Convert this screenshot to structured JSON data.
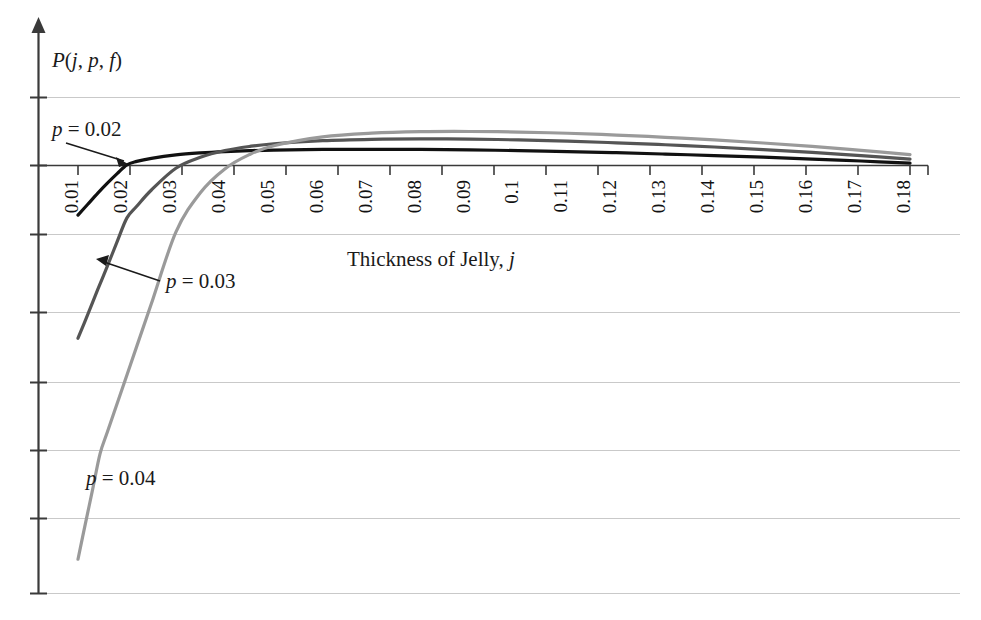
{
  "chart_data": {
    "type": "line",
    "title": "",
    "xlabel": "Thickness of Jelly, j",
    "ylabel": "P(j, p, f)",
    "grid": true,
    "legend_position": "inline-annotations",
    "xlim": [
      0.005,
      0.1875
    ],
    "ylim": [
      -6.3,
      1.45
    ],
    "xticks": [
      "0.01",
      "0.02",
      "0.03",
      "0.04",
      "0.05",
      "0.06",
      "0.07",
      "0.08",
      "0.09",
      "0.1",
      "0.11",
      "0.12",
      "0.13",
      "0.14",
      "0.15",
      "0.16",
      "0.17",
      "0.18"
    ],
    "xtick_values": [
      0.01,
      0.02,
      0.03,
      0.04,
      0.05,
      0.06,
      0.07,
      0.08,
      0.09,
      0.1,
      0.11,
      0.12,
      0.13,
      0.14,
      0.15,
      0.16,
      0.17,
      0.18
    ],
    "ytick_values": [
      1.0,
      0.0,
      -1.0,
      -2.0,
      -3.0,
      -4.0,
      -5.0,
      -6.0
    ],
    "yticklabels": [
      "",
      "",
      "",
      "",
      "",
      "",
      "",
      ""
    ],
    "series": [
      {
        "name": "p = 0.02",
        "color": "#111111",
        "annotation": "p = 0.02",
        "x": [
          0.01,
          0.012,
          0.014,
          0.016,
          0.018,
          0.02,
          0.022,
          0.025,
          0.03,
          0.035,
          0.04,
          0.045,
          0.05,
          0.06,
          0.07,
          0.08,
          0.09,
          0.1,
          0.11,
          0.12,
          0.13,
          0.14,
          0.15,
          0.16,
          0.17,
          0.18
        ],
        "y": [
          -0.73,
          -0.57,
          -0.41,
          -0.26,
          -0.12,
          0.01,
          0.06,
          0.105,
          0.155,
          0.185,
          0.205,
          0.218,
          0.227,
          0.236,
          0.238,
          0.236,
          0.229,
          0.219,
          0.205,
          0.188,
          0.168,
          0.146,
          0.122,
          0.095,
          0.066,
          0.035
        ]
      },
      {
        "name": "p = 0.03",
        "color": "#555555",
        "annotation": "p = 0.03",
        "x": [
          0.01,
          0.012,
          0.014,
          0.016,
          0.018,
          0.02,
          0.022,
          0.025,
          0.03,
          0.035,
          0.04,
          0.045,
          0.05,
          0.06,
          0.07,
          0.08,
          0.09,
          0.1,
          0.11,
          0.12,
          0.13,
          0.14,
          0.15,
          0.16,
          0.17,
          0.18
        ],
        "y": [
          -2.54,
          -2.19,
          -1.83,
          -1.48,
          -1.12,
          -0.77,
          -0.6,
          -0.36,
          -0.04,
          0.12,
          0.22,
          0.28,
          0.32,
          0.365,
          0.385,
          0.392,
          0.388,
          0.376,
          0.358,
          0.334,
          0.305,
          0.272,
          0.234,
          0.192,
          0.146,
          0.095
        ]
      },
      {
        "name": "p = 0.04",
        "color": "#9a9a9a",
        "annotation": "p = 0.04",
        "x": [
          0.01,
          0.0115,
          0.013,
          0.0145,
          0.016,
          0.018,
          0.02,
          0.022,
          0.025,
          0.03,
          0.035,
          0.04,
          0.045,
          0.05,
          0.06,
          0.07,
          0.08,
          0.09,
          0.1,
          0.11,
          0.12,
          0.13,
          0.14,
          0.15,
          0.16,
          0.17,
          0.18
        ],
        "y": [
          -5.79,
          -5.27,
          -4.76,
          -4.24,
          -3.92,
          -3.5,
          -3.08,
          -2.66,
          -2.03,
          -0.98,
          -0.4,
          -0.05,
          0.16,
          0.29,
          0.42,
          0.475,
          0.497,
          0.5,
          0.492,
          0.474,
          0.448,
          0.415,
          0.376,
          0.331,
          0.28,
          0.223,
          0.16
        ]
      }
    ],
    "annotations": [
      {
        "label": "p = 0.02",
        "target_x": 0.0195,
        "target_y": 0.02
      },
      {
        "label": "p = 0.03",
        "target_x": 0.0142,
        "target_y": -1.55
      },
      {
        "label": "p = 0.04",
        "target_x": null,
        "target_y": null
      }
    ]
  },
  "axes": {
    "y_axis_caption": "P(j, p, f)",
    "y_axis_caption_parts": {
      "p": "P",
      "open": "(",
      "j": "j",
      "c1": ", ",
      "pp": "p",
      "c2": ", ",
      "f": "f",
      "close": ")"
    },
    "x_axis_caption": "Thickness of Jelly, j",
    "x_axis_caption_main": "Thickness of Jelly,",
    "x_axis_caption_symbol": "j"
  },
  "labels": {
    "p002_var": "p",
    "p002_eq": "= 0.02",
    "p003_var": "p",
    "p003_eq": "= 0.03",
    "p004_var": "p",
    "p004_eq": "= 0.04"
  },
  "colors": {
    "series_p002": "#111111",
    "series_p003": "#555555",
    "series_p004": "#9a9a9a",
    "gridline": "#c9c9c9",
    "axis": "#3a3a3a",
    "background": "#ffffff"
  }
}
